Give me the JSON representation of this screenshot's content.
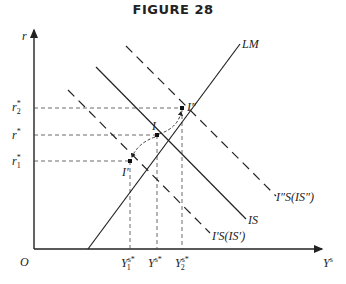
{
  "figure": {
    "title": "FIGURE 28",
    "y_axis_label": "r",
    "x_axis_label": "Y",
    "x_axis_label_sup": "s",
    "origin_label": "O"
  },
  "y_ticks": [
    {
      "base": "r",
      "sup": "*",
      "sub": "2",
      "y": 108
    },
    {
      "base": "r",
      "sup": "*",
      "sub": "",
      "y": 135
    },
    {
      "base": "r",
      "sup": "*",
      "sub": "1",
      "y": 161
    }
  ],
  "x_ticks": [
    {
      "base": "Y",
      "sup": "s*",
      "sub": "1",
      "x": 130
    },
    {
      "base": "Y",
      "sup": "s*",
      "sub": "",
      "x": 157
    },
    {
      "base": "Y",
      "sup": "s*",
      "sub": "2",
      "x": 182
    }
  ],
  "curves": {
    "lm": "LM",
    "is": "IS",
    "is_prime": "I′S(IS′)",
    "is_double_prime": "I″S(IS″)"
  },
  "points": {
    "i": "I",
    "i_prime": "I′",
    "i_double_prime": "I″"
  },
  "colors": {
    "ink": "#222222",
    "background": "#ffffff"
  }
}
